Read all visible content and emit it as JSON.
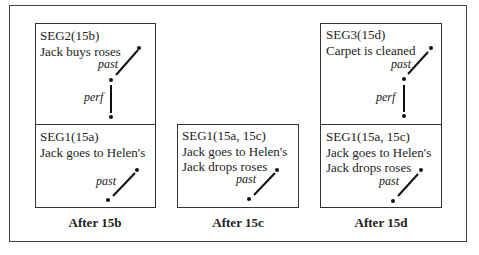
{
  "columns": [
    {
      "caption": "After 15b",
      "segments": [
        {
          "title": "SEG2(15b)",
          "lines": [
            "Jack buys roses"
          ],
          "relations": [
            "past",
            "perf"
          ]
        },
        {
          "title": "SEG1(15a)",
          "lines": [
            "Jack goes to Helen's"
          ],
          "relations": [
            "past"
          ]
        }
      ]
    },
    {
      "caption": "After 15c",
      "segments": [
        {
          "title": "SEG1(15a, 15c)",
          "lines": [
            "Jack goes to Helen's",
            "Jack drops roses"
          ],
          "relations": [
            "past"
          ]
        }
      ]
    },
    {
      "caption": "After 15d",
      "segments": [
        {
          "title": "SEG3(15d)",
          "lines": [
            "Carpet is cleaned"
          ],
          "relations": [
            "past",
            "perf"
          ]
        },
        {
          "title": "SEG1(15a, 15c)",
          "lines": [
            "Jack goes to Helen's",
            "Jack drops roses"
          ],
          "relations": [
            "past"
          ]
        }
      ]
    }
  ]
}
